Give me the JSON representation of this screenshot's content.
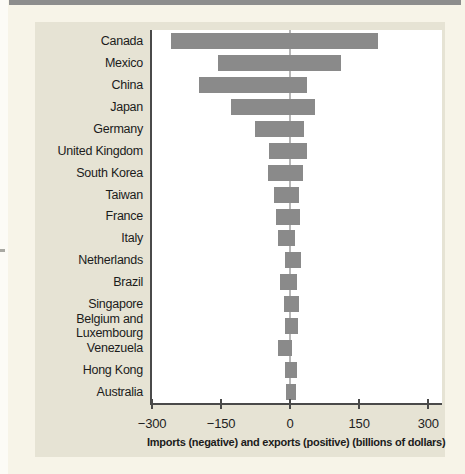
{
  "page": {
    "background_color": "#f7f4e8",
    "panel_color": "#e6e3d4",
    "top_bar_color": "#8d8d8d",
    "bar_color": "#8a8a8a",
    "axis_color": "#4a4a4a",
    "zero_line_color": "#b7b7b7",
    "text_color": "#1b1b1b"
  },
  "chart_data": {
    "type": "bar",
    "orientation": "horizontal",
    "title": "",
    "xlabel": "Imports (negative) and exports (positive) (billions of dollars)",
    "ylabel": "",
    "xlim": [
      -300,
      330
    ],
    "x_ticks": [
      -300,
      -150,
      0,
      150,
      300
    ],
    "x_tick_labels": [
      "−300",
      "−150",
      "0",
      "150",
      "300"
    ],
    "grid": false,
    "legend": false,
    "zero_line": true,
    "categories": [
      "Canada",
      "Mexico",
      "China",
      "Japan",
      "Germany",
      "United Kingdom",
      "South Korea",
      "Taiwan",
      "France",
      "Italy",
      "Netherlands",
      "Brazil",
      "Singapore",
      "Belgium and Luxembourg",
      "Venezuela",
      "Hong Kong",
      "Australia"
    ],
    "series": [
      {
        "name": "Imports (negative)",
        "values": [
          -259,
          -157,
          -197,
          -129,
          -77,
          -46,
          -47,
          -34,
          -31,
          -27,
          -12,
          -22,
          -14,
          -12,
          -26,
          -10,
          -8
        ]
      },
      {
        "name": "Exports (positive)",
        "values": [
          192,
          110,
          36,
          54,
          31,
          36,
          27,
          20,
          21,
          11,
          24,
          14,
          20,
          17,
          5,
          16,
          13
        ]
      }
    ]
  }
}
